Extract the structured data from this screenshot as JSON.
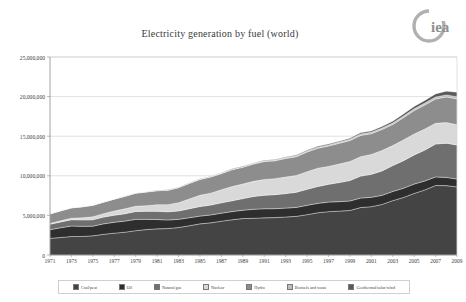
{
  "logo": {
    "name": "iea-logo",
    "text": "iea",
    "color": "#9a9a9a"
  },
  "title": "Electricity generation by fuel (world)",
  "chart_data": {
    "type": "area",
    "stacked": true,
    "title": "Electricity generation by fuel (world)",
    "xlabel": "",
    "ylabel": "",
    "ylim": [
      0,
      25000000
    ],
    "yticks": [
      0,
      5000000,
      10000000,
      15000000,
      20000000,
      25000000
    ],
    "ytick_labels": [
      "0",
      "5,000,000",
      "10,000,000",
      "15,000,000",
      "20,000,000",
      "25,000,000"
    ],
    "grid": true,
    "legend_position": "bottom",
    "x": [
      1971,
      1972,
      1973,
      1974,
      1975,
      1976,
      1977,
      1978,
      1979,
      1980,
      1981,
      1982,
      1983,
      1984,
      1985,
      1986,
      1987,
      1988,
      1989,
      1990,
      1991,
      1992,
      1993,
      1994,
      1995,
      1996,
      1997,
      1998,
      1999,
      2000,
      2001,
      2002,
      2003,
      2004,
      2005,
      2006,
      2007,
      2008,
      2009
    ],
    "xtick_labels": [
      "1971",
      "1973",
      "1975",
      "1977",
      "1979",
      "1981",
      "1983",
      "1985",
      "1987",
      "1989",
      "1991",
      "1993",
      "1995",
      "1997",
      "1999",
      "2001",
      "2003",
      "2005",
      "2007",
      "2009"
    ],
    "series": [
      {
        "name": "Coal/peat",
        "color": "#444444",
        "values": [
          2100000,
          2210000,
          2330000,
          2340000,
          2420000,
          2610000,
          2760000,
          2880000,
          3070000,
          3210000,
          3300000,
          3340000,
          3470000,
          3690000,
          3930000,
          4060000,
          4270000,
          4450000,
          4600000,
          4640000,
          4690000,
          4720000,
          4800000,
          4880000,
          5090000,
          5330000,
          5470000,
          5540000,
          5620000,
          5990000,
          6100000,
          6380000,
          6860000,
          7260000,
          7770000,
          8220000,
          8770000,
          8760000,
          8600000
        ]
      },
      {
        "name": "Oil",
        "color": "#2e2e2e",
        "values": [
          1100000,
          1230000,
          1330000,
          1280000,
          1220000,
          1320000,
          1370000,
          1400000,
          1430000,
          1290000,
          1180000,
          1080000,
          1030000,
          1010000,
          980000,
          1000000,
          1010000,
          1030000,
          1060000,
          1130000,
          1150000,
          1130000,
          1120000,
          1130000,
          1180000,
          1190000,
          1210000,
          1200000,
          1200000,
          1200000,
          1180000,
          1150000,
          1160000,
          1170000,
          1190000,
          1130000,
          1090000,
          1040000,
          990000
        ]
      },
      {
        "name": "Natural gas",
        "color": "#6f6f6f",
        "values": [
          680000,
          740000,
          790000,
          810000,
          810000,
          860000,
          890000,
          930000,
          990000,
          1020000,
          1030000,
          1040000,
          1060000,
          1140000,
          1210000,
          1240000,
          1310000,
          1370000,
          1460000,
          1620000,
          1700000,
          1770000,
          1830000,
          1910000,
          2030000,
          2130000,
          2240000,
          2410000,
          2580000,
          2770000,
          2900000,
          3090000,
          3270000,
          3480000,
          3680000,
          3900000,
          4150000,
          4320000,
          4300000
        ]
      },
      {
        "name": "Nuclear",
        "color": "#d9d9d9",
        "values": [
          110000,
          150000,
          200000,
          260000,
          370000,
          430000,
          530000,
          620000,
          670000,
          710000,
          840000,
          900000,
          1030000,
          1240000,
          1420000,
          1510000,
          1640000,
          1790000,
          1840000,
          1910000,
          2000000,
          2020000,
          2090000,
          2120000,
          2210000,
          2310000,
          2270000,
          2330000,
          2400000,
          2450000,
          2520000,
          2570000,
          2520000,
          2620000,
          2630000,
          2660000,
          2610000,
          2600000,
          2560000
        ]
      },
      {
        "name": "Hydro",
        "color": "#8d8d8d",
        "values": [
          1200000,
          1250000,
          1300000,
          1390000,
          1450000,
          1450000,
          1500000,
          1570000,
          1640000,
          1720000,
          1760000,
          1810000,
          1900000,
          1950000,
          1990000,
          2030000,
          2040000,
          2120000,
          2110000,
          2180000,
          2250000,
          2250000,
          2350000,
          2370000,
          2490000,
          2520000,
          2570000,
          2620000,
          2650000,
          2690000,
          2620000,
          2660000,
          2660000,
          2810000,
          2970000,
          3040000,
          3080000,
          3230000,
          3270000
        ]
      },
      {
        "name": "Biofuels and waste",
        "color": "#bdbdbd",
        "values": [
          10000,
          12000,
          14000,
          16000,
          18000,
          20000,
          23000,
          26000,
          29000,
          33000,
          37000,
          41000,
          46000,
          52000,
          58000,
          64000,
          71000,
          78000,
          85000,
          92000,
          98000,
          105000,
          112000,
          120000,
          128000,
          136000,
          144000,
          152000,
          160000,
          168000,
          176000,
          185000,
          195000,
          205000,
          215000,
          228000,
          242000,
          256000,
          270000
        ]
      },
      {
        "name": "Geothermal/solar/wind",
        "color": "#5a5a5a",
        "values": [
          4000,
          5000,
          6000,
          7000,
          8000,
          9000,
          11000,
          13000,
          15000,
          17000,
          19000,
          22000,
          25000,
          28000,
          32000,
          36000,
          40000,
          45000,
          50000,
          56000,
          62000,
          68000,
          75000,
          83000,
          91000,
          100000,
          110000,
          122000,
          136000,
          152000,
          170000,
          192000,
          218000,
          250000,
          290000,
          340000,
          400000,
          470000,
          560000
        ]
      }
    ]
  },
  "legend": {
    "items": [
      {
        "label": "Coal/peat",
        "color": "#444444"
      },
      {
        "label": "Oil",
        "color": "#2e2e2e"
      },
      {
        "label": "Natural gas",
        "color": "#6f6f6f"
      },
      {
        "label": "Nuclear",
        "color": "#d9d9d9"
      },
      {
        "label": "Hydro",
        "color": "#8d8d8d"
      },
      {
        "label": "Biofuels and waste",
        "color": "#bdbdbd"
      },
      {
        "label": "Geothermal/solar/wind",
        "color": "#5a5a5a"
      }
    ]
  }
}
